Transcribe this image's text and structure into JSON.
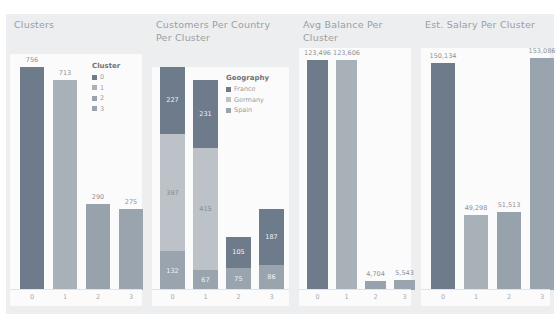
{
  "background": "#ffffff",
  "board_color": "#eceef0",
  "plot_color": "#fbfbfc",
  "palette": {
    "cluster_0": "#6e7b8b",
    "cluster_1": "#a8b0b8",
    "cluster_2": "#98a2ac",
    "cluster_3": "#9aa4ae",
    "france": "#6e7b8b",
    "germany": "#bcc2c8",
    "spain": "#9aa4ae",
    "label_text": "#8e9196",
    "title_text": "#9b9ea3"
  },
  "panels": [
    {
      "id": "clusters",
      "title": "Clusters",
      "legend": {
        "title": "Cluster",
        "items": [
          {
            "label": "0",
            "color": "#6e7b8b"
          },
          {
            "label": "1",
            "color": "#a8b0b8"
          },
          {
            "label": "2",
            "color": "#98a2ac"
          },
          {
            "label": "3",
            "color": "#9aa4ae"
          }
        ]
      }
    },
    {
      "id": "customers-per-country",
      "title": "Customers Per Country Per Cluster",
      "legend": {
        "title": "Geography",
        "items": [
          {
            "label": "France",
            "color": "#6e7b8b"
          },
          {
            "label": "Germany",
            "color": "#bcc2c8"
          },
          {
            "label": "Spain",
            "color": "#9aa4ae"
          }
        ]
      }
    },
    {
      "id": "avg-balance",
      "title": "Avg Balance Per Cluster",
      "legend": null
    },
    {
      "id": "est-salary",
      "title": "Est. Salary Per Cluster",
      "legend": null
    }
  ],
  "chart_data": [
    {
      "type": "bar",
      "title": "Clusters",
      "xlabel": "",
      "ylabel": "",
      "categories": [
        "0",
        "1",
        "2",
        "3"
      ],
      "values": [
        756,
        713,
        290,
        275
      ],
      "value_labels": [
        "756",
        "713",
        "290",
        "275"
      ],
      "colors": [
        "#6e7b8b",
        "#a8b0b8",
        "#98a2ac",
        "#9aa4ae"
      ],
      "ylim": [
        0,
        800
      ],
      "grid": false,
      "legend_position": "inside-right",
      "legend_title": "Cluster",
      "legend_entries": [
        "0",
        "1",
        "2",
        "3"
      ]
    },
    {
      "type": "bar",
      "subtype": "stacked",
      "title": "Customers Per Country Per Cluster",
      "xlabel": "",
      "ylabel": "",
      "categories": [
        "0",
        "1",
        "2",
        "3"
      ],
      "series": [
        {
          "name": "France",
          "color": "#6e7b8b",
          "values": [
            227,
            231,
            105,
            187
          ],
          "value_labels": [
            "227",
            "231",
            "105",
            "187"
          ]
        },
        {
          "name": "Germany",
          "color": "#bcc2c8",
          "values": [
            397,
            415,
            0,
            0
          ],
          "value_labels": [
            "397",
            "415",
            "",
            ""
          ]
        },
        {
          "name": "Spain",
          "color": "#9aa4ae",
          "values": [
            132,
            67,
            75,
            86
          ],
          "value_labels": [
            "132",
            "67",
            "75",
            "86"
          ]
        }
      ],
      "ylim": [
        0,
        756
      ],
      "grid": false,
      "legend_position": "inside-right",
      "legend_title": "Geography",
      "legend_entries": [
        "France",
        "Germany",
        "Spain"
      ]
    },
    {
      "type": "bar",
      "title": "Avg Balance Per Cluster",
      "xlabel": "",
      "ylabel": "",
      "categories": [
        "0",
        "1",
        "2",
        "3"
      ],
      "values": [
        123496,
        123606,
        4704,
        5543
      ],
      "value_labels": [
        "123,496",
        "123,606",
        "4,704",
        "5,543"
      ],
      "colors": [
        "#6e7b8b",
        "#a8b0b8",
        "#98a2ac",
        "#9aa4ae"
      ],
      "ylim": [
        0,
        130000
      ],
      "grid": false,
      "legend_position": "none"
    },
    {
      "type": "bar",
      "title": "Est. Salary Per Cluster",
      "xlabel": "",
      "ylabel": "",
      "categories": [
        "0",
        "1",
        "2",
        "3"
      ],
      "values": [
        150134,
        49298,
        51513,
        153086
      ],
      "value_labels": [
        "150,134",
        "49,298",
        "51,513",
        "153,086"
      ],
      "colors": [
        "#6e7b8b",
        "#a8b0b8",
        "#98a2ac",
        "#9aa4ae"
      ],
      "ylim": [
        0,
        160000
      ],
      "grid": false,
      "legend_position": "none"
    }
  ]
}
